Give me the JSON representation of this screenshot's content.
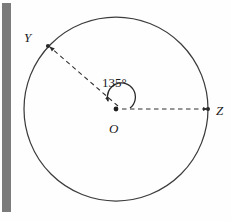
{
  "figure": {
    "type": "geometry-diagram",
    "background_color": "#fefefe",
    "stroke_color": "#3a3a3a",
    "scan_bar_color": "#7b7b7b",
    "canvas": {
      "width": 231,
      "height": 221
    },
    "circle": {
      "center_x": 116,
      "center_y": 109,
      "radius": 92,
      "stroke_width": 1.2
    },
    "center_point": {
      "label": "O",
      "x": 116,
      "y": 109
    },
    "points": [
      {
        "label": "Y",
        "x": 48,
        "y": 44,
        "angle_deg": 135
      },
      {
        "label": "Z",
        "x": 208,
        "y": 109,
        "angle_deg": 0
      }
    ],
    "radii": [
      {
        "name": "OY",
        "from": "O",
        "to": "Y",
        "style": "dashed",
        "arrowhead": true
      },
      {
        "name": "OZ",
        "from": "O",
        "to": "Z",
        "style": "dashed",
        "arrowhead": true
      }
    ],
    "angle_arc": {
      "label": "135°",
      "value": 135,
      "unit": "degrees",
      "vertex": "O",
      "from_ray": "OZ",
      "to_ray": "OY",
      "arrowhead": true,
      "radius": 14
    }
  }
}
